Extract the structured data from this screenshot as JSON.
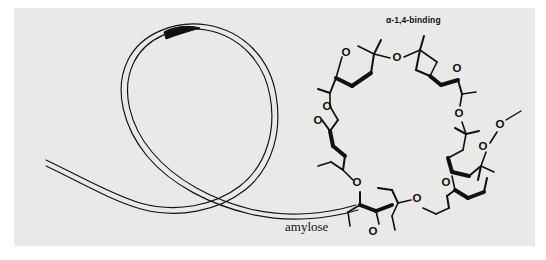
{
  "figure": {
    "name": "amylose-helix-alpha-1-4-binding-diagram",
    "background_color": "#ffffff",
    "panel_color": "#e9e9e7",
    "ink_color": "#111111"
  },
  "labels": {
    "alpha_binding": "α-1,4-binding",
    "amylose": "amylose"
  },
  "atoms": {
    "oxygen_symbol": "O"
  },
  "structure": {
    "helix": {
      "description": "amylose double-line helical ribbon loop",
      "ribbon_lines": 2
    },
    "macrocycle": {
      "description": "ring of alpha-1,4-linked glucopyranose units",
      "ring_oxygen_count": 6,
      "glycosidic_oxygen_count": 6,
      "terminal_group": "O-methyl"
    }
  }
}
